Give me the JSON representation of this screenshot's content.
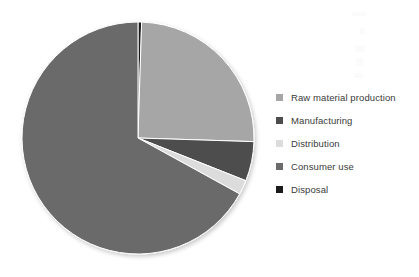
{
  "chart_data": {
    "type": "pie",
    "title": "",
    "subtitle": "",
    "xlabel": "",
    "ylabel": "",
    "legend_position": "right",
    "grid": false,
    "start_angle_deg": 0,
    "direction": "clockwise",
    "center": {
      "x": 138,
      "y": 138
    },
    "radius": 116,
    "categories": [
      "Raw material production",
      "Manufacturing",
      "Distribution",
      "Consumer use",
      "Disposal"
    ],
    "values": [
      25,
      5.5,
      2,
      67,
      0.5
    ],
    "units": "percent",
    "slices": [
      {
        "label": "Disposal",
        "value": 0.5,
        "color": "#1a1a1a",
        "start_deg": 0,
        "end_deg": 1.8
      },
      {
        "label": "Raw material production",
        "value": 25,
        "color": "#a6a6a6",
        "start_deg": 1.8,
        "end_deg": 91.8
      },
      {
        "label": "Manufacturing",
        "value": 5.5,
        "color": "#4d4d4d",
        "start_deg": 91.8,
        "end_deg": 111.6
      },
      {
        "label": "Distribution",
        "value": 2,
        "color": "#dcdcdc",
        "start_deg": 111.6,
        "end_deg": 118.8
      },
      {
        "label": "Consumer use",
        "value": 67,
        "color": "#6b6b6b",
        "start_deg": 118.8,
        "end_deg": 360
      }
    ],
    "legend": [
      {
        "label": "Raw material production",
        "color": "#a6a6a6"
      },
      {
        "label": "Manufacturing",
        "color": "#4d4d4d"
      },
      {
        "label": "Distribution",
        "color": "#dcdcdc"
      },
      {
        "label": "Consumer use",
        "color": "#6b6b6b"
      },
      {
        "label": "Disposal",
        "color": "#1a1a1a"
      }
    ]
  }
}
